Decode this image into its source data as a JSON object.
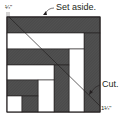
{
  "diagram": {
    "type": "log-cabin quilt block cutting diagram",
    "colors": {
      "dark_fabric": "#4a4a4a",
      "light_fabric": "#ffffff",
      "outline": "#231f20"
    },
    "labels": {
      "set_aside": "Set aside.",
      "cut": "Cut.",
      "top_measure": "¼\"",
      "bottom_measure": "1¼\""
    },
    "cut_line": {
      "from": "top-left corner offset ¼\"",
      "to": "bottom-right corner offset 1¼\""
    }
  }
}
